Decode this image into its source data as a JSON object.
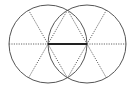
{
  "diagram": {
    "type": "geometric-construction",
    "colors": {
      "background": "#ffffff",
      "stroke": "#555555",
      "bold": "#222222"
    },
    "circles": [
      {
        "id": "left-circle",
        "cx": 48,
        "cy": 44,
        "r": 39
      },
      {
        "id": "right-circle",
        "cx": 87,
        "cy": 44,
        "r": 39
      }
    ],
    "intersections": [
      {
        "id": "top",
        "x": 67.5,
        "y": 10
      },
      {
        "id": "bottom",
        "x": 67.5,
        "y": 78
      }
    ],
    "bold_segment": {
      "x1": 48,
      "y1": 44,
      "x2": 87,
      "y2": 44
    },
    "dotted_lines": [
      {
        "id": "left-horizontal-radius",
        "x1": 9,
        "y1": 44,
        "x2": 48,
        "y2": 44
      },
      {
        "id": "right-horizontal-radius",
        "x1": 87,
        "y1": 44,
        "x2": 126,
        "y2": 44
      },
      {
        "id": "left-diameter-a",
        "x1": 28.5,
        "y1": 10,
        "x2": 67.5,
        "y2": 78
      },
      {
        "id": "left-diameter-b",
        "x1": 67.5,
        "y1": 10,
        "x2": 28.5,
        "y2": 78
      },
      {
        "id": "right-diameter-a",
        "x1": 106.5,
        "y1": 10,
        "x2": 67.5,
        "y2": 78
      },
      {
        "id": "right-diameter-b",
        "x1": 67.5,
        "y1": 10,
        "x2": 106.5,
        "y2": 78
      }
    ]
  }
}
